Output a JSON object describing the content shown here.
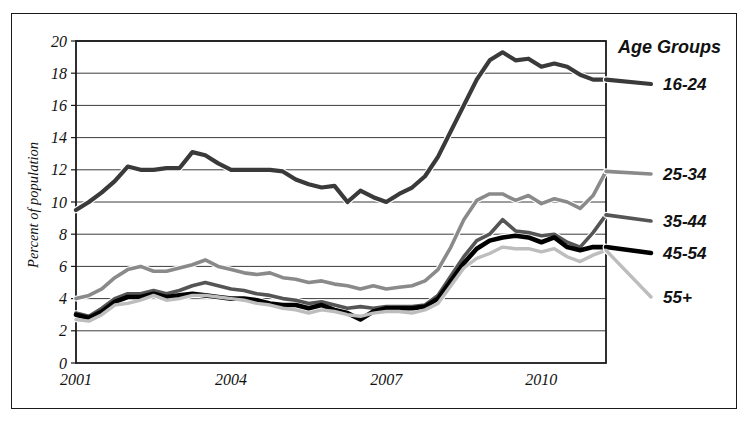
{
  "chart_data": {
    "type": "line",
    "title": "",
    "xlabel": "",
    "ylabel": "Percent of population",
    "ylim": [
      0,
      20
    ],
    "ytick_step": 2,
    "yticks": [
      "0",
      "2",
      "4",
      "6",
      "8",
      "10",
      "12",
      "14",
      "16",
      "18",
      "20"
    ],
    "xticks": [
      "2001",
      "2004",
      "2007",
      "2010"
    ],
    "xtick_values": [
      2001,
      2004,
      2007,
      2010
    ],
    "xlim": [
      2001,
      2011.25
    ],
    "grid": "horizontal",
    "legend_title": "Age Groups",
    "legend_position": "right-outside",
    "x": [
      2001.0,
      2001.25,
      2001.5,
      2001.75,
      2002.0,
      2002.25,
      2002.5,
      2002.75,
      2003.0,
      2003.25,
      2003.5,
      2003.75,
      2004.0,
      2004.25,
      2004.5,
      2004.75,
      2005.0,
      2005.25,
      2005.5,
      2005.75,
      2006.0,
      2006.25,
      2006.5,
      2006.75,
      2007.0,
      2007.25,
      2007.5,
      2007.75,
      2008.0,
      2008.25,
      2008.5,
      2008.75,
      2009.0,
      2009.25,
      2009.5,
      2009.75,
      2010.0,
      2010.25,
      2010.5,
      2010.75,
      2011.0,
      2011.25
    ],
    "series": [
      {
        "name": "16-24",
        "color": "#3a3a3a",
        "width": 4.2,
        "label_y": 17.6,
        "values": [
          9.5,
          10.0,
          10.6,
          11.3,
          12.2,
          12.0,
          12.0,
          12.1,
          12.1,
          13.1,
          12.9,
          12.4,
          12.0,
          12.0,
          12.0,
          12.0,
          11.9,
          11.4,
          11.1,
          10.9,
          11.0,
          10.0,
          10.7,
          10.3,
          10.0,
          10.5,
          10.9,
          11.6,
          12.8,
          14.4,
          16.0,
          17.6,
          18.8,
          19.3,
          18.8,
          18.9,
          18.4,
          18.6,
          18.4,
          17.9,
          17.6,
          17.6
        ]
      },
      {
        "name": "25-34",
        "color": "#8a8a8a",
        "width": 3.6,
        "label_y": 11.9,
        "values": [
          4.0,
          4.2,
          4.6,
          5.3,
          5.8,
          6.0,
          5.7,
          5.7,
          5.9,
          6.1,
          6.4,
          6.0,
          5.8,
          5.6,
          5.5,
          5.6,
          5.3,
          5.2,
          5.0,
          5.1,
          4.9,
          4.8,
          4.6,
          4.8,
          4.6,
          4.7,
          4.8,
          5.1,
          5.8,
          7.2,
          8.9,
          10.1,
          10.5,
          10.5,
          10.1,
          10.4,
          9.9,
          10.2,
          10.0,
          9.6,
          10.4,
          11.9
        ]
      },
      {
        "name": "35-44",
        "color": "#555555",
        "width": 3.6,
        "label_y": 9.2,
        "values": [
          3.1,
          2.9,
          3.4,
          4.0,
          4.3,
          4.3,
          4.5,
          4.3,
          4.5,
          4.8,
          5.0,
          4.8,
          4.6,
          4.5,
          4.3,
          4.2,
          4.0,
          3.9,
          3.7,
          3.8,
          3.6,
          3.4,
          3.5,
          3.4,
          3.5,
          3.5,
          3.5,
          3.6,
          4.2,
          5.4,
          6.6,
          7.6,
          8.0,
          8.9,
          8.2,
          8.1,
          7.9,
          8.0,
          7.5,
          7.2,
          8.1,
          9.2
        ]
      },
      {
        "name": "45-54",
        "color": "#000000",
        "width": 4.6,
        "label_y": 7.2,
        "values": [
          3.0,
          2.8,
          3.2,
          3.8,
          4.1,
          4.1,
          4.3,
          4.1,
          4.2,
          4.3,
          4.2,
          4.1,
          4.0,
          4.0,
          3.9,
          3.7,
          3.6,
          3.6,
          3.4,
          3.6,
          3.3,
          3.1,
          2.7,
          3.2,
          3.4,
          3.4,
          3.4,
          3.5,
          4.0,
          5.1,
          6.2,
          7.1,
          7.6,
          7.8,
          7.9,
          7.8,
          7.5,
          7.8,
          7.2,
          7.0,
          7.2,
          7.2
        ]
      },
      {
        "name": "55+",
        "color": "#bdbdbd",
        "width": 3.4,
        "label_y": 4.6,
        "values": [
          2.7,
          2.6,
          3.0,
          3.6,
          3.7,
          3.9,
          4.2,
          3.9,
          4.0,
          4.2,
          4.2,
          4.1,
          4.0,
          3.9,
          3.7,
          3.6,
          3.4,
          3.3,
          3.1,
          3.3,
          3.2,
          3.0,
          2.9,
          3.1,
          3.2,
          3.2,
          3.1,
          3.3,
          3.7,
          4.8,
          5.9,
          6.5,
          6.8,
          7.2,
          7.1,
          7.1,
          6.9,
          7.1,
          6.6,
          6.3,
          6.7,
          7.0
        ]
      }
    ]
  },
  "axis": {
    "y_title": "Percent of population"
  },
  "legend": {
    "title": "Age Groups",
    "items": [
      {
        "label": "16-24"
      },
      {
        "label": "25-34"
      },
      {
        "label": "35-44"
      },
      {
        "label": "45-54"
      },
      {
        "label": "55+"
      }
    ]
  }
}
